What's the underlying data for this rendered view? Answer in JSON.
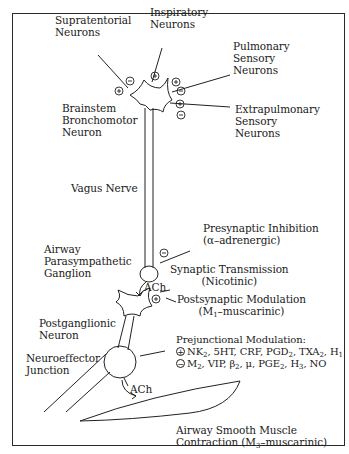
{
  "diagram": {
    "inputs": {
      "supratentorial": {
        "line1": "Supratentorial",
        "line2": "Neurons",
        "signs": [
          "+",
          "-"
        ]
      },
      "inspiratory": {
        "line1": "Inspiratory",
        "line2": "Neurons",
        "signs": [
          "+"
        ]
      },
      "pulmonary": {
        "line1": "Pulmonary",
        "line2": "Sensory",
        "line3": "Neurons",
        "signs": [
          "+",
          "-"
        ]
      },
      "extrapulmonary": {
        "line1": "Extrapulmonary",
        "line2": "Sensory",
        "line3": "Neurons",
        "signs": [
          "+",
          "-"
        ]
      }
    },
    "brainstem": {
      "line1": "Brainstem",
      "line2": "Bronchomotor",
      "line3": "Neuron"
    },
    "vagus": {
      "label": "Vagus Nerve"
    },
    "ganglion": {
      "line1": "Airway",
      "line2": "Parasympathetic",
      "line3": "Ganglion"
    },
    "presynaptic": {
      "line1": "Presynaptic Inhibition",
      "line2": "(α–adrenergic)",
      "sign": "-"
    },
    "synaptic": {
      "line1": "Synaptic Transmission",
      "line2": "(Nicotinic)",
      "transmitter": "ACh"
    },
    "postsynaptic": {
      "line1": "Postsynaptic Modulation",
      "line2_pre": "(M",
      "line2_sub": "1",
      "line2_post": "–muscarinic)",
      "sign": "+"
    },
    "postganglionic": {
      "line1": "Postganglionic",
      "line2": "Neuron"
    },
    "prejunctional": {
      "title": "Prejunctional Modulation:",
      "excitatory_sign": "+",
      "excitatory": [
        "NK2",
        "5HT",
        "CRF",
        "PGD2",
        "TXA2",
        "H1"
      ],
      "inhibitory_sign": "-",
      "inhibitory": [
        "M2",
        "VIP",
        "β2",
        "μ",
        "PGE2",
        "H3",
        "NO"
      ]
    },
    "neuroeffector": {
      "line1": "Neuroeffector",
      "line2": "Junction",
      "transmitter": "ACh"
    },
    "smooth_muscle": {
      "line1": "Airway Smooth Muscle",
      "line2_pre": "Contraction (M",
      "line2_sub": "3",
      "line2_post": "–muscarinic)"
    }
  }
}
